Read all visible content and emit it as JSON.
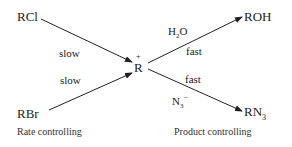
{
  "diagram": {
    "reactants": [
      {
        "id": "rcl",
        "label": "RCl"
      },
      {
        "id": "rbr",
        "label": "RBr"
      }
    ],
    "intermediate": {
      "label": "R",
      "charge": "+"
    },
    "products": [
      {
        "id": "roh",
        "label": "ROH"
      },
      {
        "id": "rn3",
        "label": "RN",
        "subscript": "3"
      }
    ],
    "edges": [
      {
        "from": "RCl",
        "to": "R+",
        "label": "slow"
      },
      {
        "from": "RBr",
        "to": "R+",
        "label": "slow"
      },
      {
        "from": "R+",
        "to": "ROH",
        "reagent": "H2O",
        "label": "fast"
      },
      {
        "from": "R+",
        "to": "RN3",
        "reagent": "N3-",
        "label": "fast"
      }
    ],
    "reagents": {
      "water": {
        "main": "H",
        "sub": "2",
        "tail": "O"
      },
      "azide": {
        "main": "N",
        "sub": "3",
        "sup": "−"
      }
    },
    "edge_labels": {
      "slow1": "slow",
      "slow2": "slow",
      "fast1": "fast",
      "fast2": "fast"
    },
    "captions": {
      "left": "Rate controlling",
      "right": "Product controlling"
    }
  }
}
